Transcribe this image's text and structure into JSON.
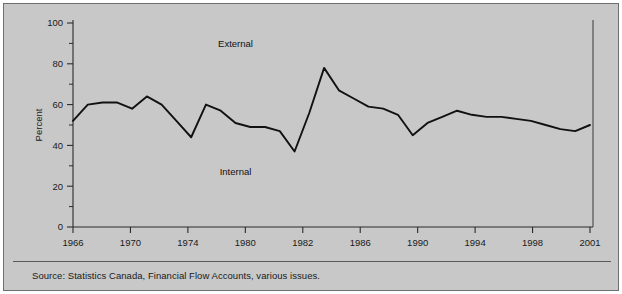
{
  "figure": {
    "background_color": "#c8c8c8",
    "border_color": "#6e6e6e",
    "source_note": "Source: Statistics Canada, Financial Flow Accounts, various issues."
  },
  "labels": {
    "external": "External",
    "internal": "Internal",
    "y_axis_title": "Percent"
  },
  "chart_data": {
    "type": "line",
    "title": "",
    "xlabel": "",
    "ylabel": "Percent",
    "xlim": [
      1966,
      2001
    ],
    "ylim": [
      0,
      100
    ],
    "grid": false,
    "legend_position": "none",
    "y_ticks": [
      0,
      20,
      40,
      60,
      80,
      100
    ],
    "y_tick_labels": [
      "0",
      "20",
      "40",
      "60",
      "80",
      "100"
    ],
    "y_minor_ticks": [
      10,
      30,
      50,
      70,
      90
    ],
    "x_tick_labels": [
      "1966",
      "1970",
      "1974",
      "1980",
      "1982",
      "1986",
      "1990",
      "1994",
      "1998",
      "2001"
    ],
    "x_tick_values": [
      1966,
      1970,
      1974,
      1978,
      1982,
      1986,
      1990,
      1994,
      1998,
      2001
    ],
    "annotations": [
      {
        "text": "External",
        "x": 1977,
        "y": 90
      },
      {
        "text": "Internal",
        "x": 1977,
        "y": 27
      }
    ],
    "series": [
      {
        "name": "External financing share",
        "color": "#111111",
        "x": [
          1966,
          1967,
          1968,
          1969,
          1970,
          1971,
          1972,
          1973,
          1974,
          1975,
          1976,
          1977,
          1978,
          1979,
          1980,
          1981,
          1982,
          1983,
          1984,
          1985,
          1986,
          1987,
          1988,
          1989,
          1990,
          1991,
          1992,
          1993,
          1994,
          1995,
          1996,
          1997,
          1998,
          1999,
          2000,
          2001
        ],
        "values": [
          52,
          60,
          61,
          61,
          58,
          64,
          60,
          52,
          44,
          60,
          57,
          51,
          49,
          49,
          47,
          37,
          56,
          78,
          67,
          63,
          59,
          58,
          55,
          45,
          51,
          54,
          57,
          55,
          54,
          54,
          53,
          52,
          50,
          48,
          47,
          50
        ]
      }
    ]
  }
}
